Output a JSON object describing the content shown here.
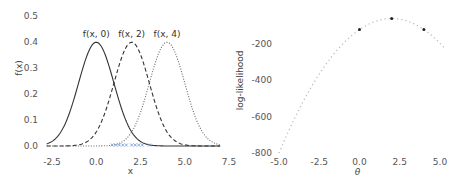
{
  "chart_data": [
    {
      "type": "line",
      "title": "",
      "xlabel": "x",
      "ylabel": "f(x)",
      "xlim": [
        -2.5,
        7.5
      ],
      "ylim": [
        0.0,
        0.5
      ],
      "xticks": [
        "-2.5",
        "0.0",
        "2.5",
        "5.0",
        "7.5"
      ],
      "yticks": [
        "0.0",
        "0.1",
        "0.2",
        "0.3",
        "0.4",
        "0.5"
      ],
      "grid": false,
      "series": [
        {
          "name": "f(x, 0)",
          "distribution": "normal",
          "mean": 0,
          "sd": 1,
          "x_range": [
            -2.8,
            7.0
          ],
          "style": "solid",
          "color": "#333333",
          "annotation": "f(x, 0)"
        },
        {
          "name": "f(x, 2)",
          "distribution": "normal",
          "mean": 2,
          "sd": 1,
          "x_range": [
            -2.8,
            7.0
          ],
          "style": "dashed",
          "color": "#333333",
          "annotation": "f(x, 2)"
        },
        {
          "name": "f(x, 4)",
          "distribution": "normal",
          "mean": 4,
          "sd": 1,
          "x_range": [
            -2.8,
            7.0
          ],
          "style": "dotted",
          "color": "#666666",
          "annotation": "f(x, 4)"
        }
      ],
      "samples": {
        "name": "observations",
        "color": "#6f93d8",
        "x": [
          0.9,
          1.1,
          1.3,
          1.5,
          1.7,
          2.0,
          2.2,
          2.4,
          2.6,
          3.0
        ],
        "y": 0
      }
    },
    {
      "type": "line",
      "title": "",
      "xlabel": "θ",
      "ylabel": "log-likelihood",
      "xlim": [
        -5.0,
        5.0
      ],
      "ylim": [
        -800,
        -50
      ],
      "xticks": [
        "-5.0",
        "-2.5",
        "0.0",
        "2.5",
        "5.0"
      ],
      "yticks": [
        "-800",
        "-600",
        "-400",
        "-200"
      ],
      "grid": false,
      "series": [
        {
          "name": "log-likelihood",
          "style": "dotted",
          "color": "#bbbbbb",
          "form": "quadratic",
          "peak_theta": 2.0,
          "peak_value": -60,
          "value_at_minus5": -800,
          "x_range": [
            -5.0,
            5.3
          ]
        }
      ],
      "points": {
        "color": "#222222",
        "theta": [
          0.0,
          2.0,
          4.0
        ],
        "value": [
          -120,
          -60,
          -120
        ]
      }
    }
  ]
}
